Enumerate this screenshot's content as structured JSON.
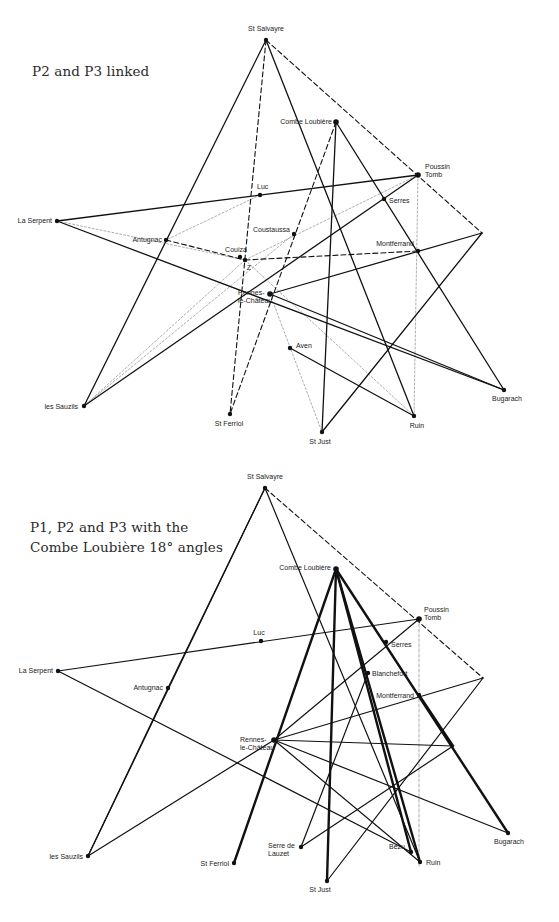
{
  "panels": [
    {
      "title": "P2 and P3 linked",
      "points": [
        {
          "id": "st-salvayre",
          "label": "St Salvayre",
          "x": 266,
          "y": 40,
          "lx": 266,
          "ly": 31,
          "anchor": "middle"
        },
        {
          "id": "combe-loubiere",
          "label": "Combe Loubière",
          "x": 336,
          "y": 122,
          "lx": 332,
          "ly": 124,
          "anchor": "end"
        },
        {
          "id": "poussin-tomb",
          "label": "Poussin",
          "label2": "Tomb",
          "x": 418,
          "y": 175,
          "lx": 425,
          "ly": 169,
          "anchor": "start"
        },
        {
          "id": "luc",
          "label": "Luc",
          "x": 260,
          "y": 195,
          "lx": 257,
          "ly": 189,
          "anchor": "start"
        },
        {
          "id": "la-serpent",
          "label": "La Serpent",
          "x": 57,
          "y": 221,
          "lx": 52,
          "ly": 223,
          "anchor": "end"
        },
        {
          "id": "serres",
          "label": "Serres",
          "x": 384,
          "y": 199,
          "lx": 389,
          "ly": 203,
          "anchor": "start"
        },
        {
          "id": "antugnac",
          "label": "Antugnac",
          "x": 166,
          "y": 240,
          "lx": 162,
          "ly": 242,
          "anchor": "end"
        },
        {
          "id": "coustaussa",
          "label": "Coustaussa",
          "x": 294,
          "y": 234,
          "lx": 290,
          "ly": 232,
          "anchor": "end"
        },
        {
          "id": "couiza",
          "label": "Couiza",
          "x": 240,
          "y": 257,
          "lx": 236,
          "ly": 252,
          "anchor": "middle"
        },
        {
          "id": "z",
          "label": "Z",
          "x": 245,
          "y": 260,
          "lx": 249,
          "ly": 270,
          "anchor": "middle"
        },
        {
          "id": "montferrand",
          "label": "Montferrand",
          "x": 418,
          "y": 251,
          "lx": 414,
          "ly": 246,
          "anchor": "end"
        },
        {
          "id": "rennes-le-chateau",
          "label": "Rennes-",
          "label2": "le-Château",
          "x": 270,
          "y": 294,
          "lx": 238,
          "ly": 295,
          "anchor": "start"
        },
        {
          "id": "aven",
          "label": "Aven",
          "x": 290,
          "y": 348,
          "lx": 296,
          "ly": 348,
          "anchor": "start"
        },
        {
          "id": "bugarach",
          "label": "Bugarach",
          "x": 504,
          "y": 390,
          "lx": 507,
          "ly": 401,
          "anchor": "middle"
        },
        {
          "id": "les-sauzils",
          "label": "les Sauzils",
          "x": 84,
          "y": 406,
          "lx": 78,
          "ly": 409,
          "anchor": "end"
        },
        {
          "id": "st-ferriol",
          "label": "St Ferriol",
          "x": 230,
          "y": 414,
          "lx": 229,
          "ly": 426,
          "anchor": "middle"
        },
        {
          "id": "ruin",
          "label": "Ruin",
          "x": 414,
          "y": 416,
          "lx": 417,
          "ly": 428,
          "anchor": "middle"
        },
        {
          "id": "st-just",
          "label": "St Just",
          "x": 322,
          "y": 432,
          "lx": 320,
          "ly": 444,
          "anchor": "middle"
        },
        {
          "id": "right-vertex",
          "label": "",
          "x": 482,
          "y": 233
        }
      ]
    },
    {
      "title_line1": "P1, P2 and P3 with the",
      "title_line2": "Combe Loubière 18° angles",
      "points": [
        {
          "id": "st-salvayre",
          "label": "St Salvayre",
          "x": 265,
          "y": 488,
          "lx": 265,
          "ly": 479,
          "anchor": "middle"
        },
        {
          "id": "combe-loubiere",
          "label": "Combe Loubière",
          "x": 336,
          "y": 569,
          "lx": 331,
          "ly": 570,
          "anchor": "end"
        },
        {
          "id": "poussin-tomb",
          "label": "Poussin",
          "label2": "Tomb",
          "x": 419,
          "y": 619,
          "lx": 424,
          "ly": 612,
          "anchor": "start"
        },
        {
          "id": "luc",
          "label": "Luc",
          "x": 261,
          "y": 641,
          "lx": 259,
          "ly": 635,
          "anchor": "middle"
        },
        {
          "id": "la-serpent",
          "label": "La Serpent",
          "x": 58,
          "y": 671,
          "lx": 53,
          "ly": 673,
          "anchor": "end"
        },
        {
          "id": "serres",
          "label": "Serres",
          "x": 386,
          "y": 642,
          "lx": 391,
          "ly": 647,
          "anchor": "start"
        },
        {
          "id": "blanchefort",
          "label": "Blanchefort",
          "x": 368,
          "y": 673,
          "lx": 372,
          "ly": 676,
          "anchor": "start"
        },
        {
          "id": "antugnac",
          "label": "Antugnac",
          "x": 168,
          "y": 688,
          "lx": 163,
          "ly": 690,
          "anchor": "end"
        },
        {
          "id": "montferrand",
          "label": "Montferrand",
          "x": 419,
          "y": 695,
          "lx": 414,
          "ly": 698,
          "anchor": "end"
        },
        {
          "id": "rennes-le-chateau",
          "label": "Rennes-",
          "label2": "le-Château",
          "x": 274,
          "y": 740,
          "lx": 240,
          "ly": 742,
          "anchor": "start"
        },
        {
          "id": "bugarach",
          "label": "Bugarach",
          "x": 508,
          "y": 833,
          "lx": 509,
          "ly": 844,
          "anchor": "middle"
        },
        {
          "id": "les-sauzils",
          "label": "les Sauzils",
          "x": 88,
          "y": 856,
          "lx": 83,
          "ly": 859,
          "anchor": "end"
        },
        {
          "id": "serre-de-lauzet",
          "label": "Serre de",
          "label2": "Lauzet",
          "x": 301,
          "y": 847,
          "lx": 268,
          "ly": 848,
          "anchor": "start"
        },
        {
          "id": "bezu",
          "label": "Bezu",
          "x": 411,
          "y": 852,
          "lx": 405,
          "ly": 849,
          "anchor": "end"
        },
        {
          "id": "st-ferriol",
          "label": "St Ferriol",
          "x": 234,
          "y": 863,
          "lx": 229,
          "ly": 866,
          "anchor": "end"
        },
        {
          "id": "ruin",
          "label": "Ruin",
          "x": 420,
          "y": 862,
          "lx": 426,
          "ly": 865,
          "anchor": "start"
        },
        {
          "id": "st-just",
          "label": "St Just",
          "x": 327,
          "y": 881,
          "lx": 320,
          "ly": 892,
          "anchor": "middle"
        },
        {
          "id": "right-vertex",
          "label": "",
          "x": 483,
          "y": 678
        },
        {
          "id": "mid-right",
          "label": "",
          "x": 453,
          "y": 746
        }
      ]
    }
  ],
  "edges_top": {
    "solid": [
      [
        "st-salvayre",
        "les-sauzils"
      ],
      [
        "st-salvayre",
        "ruin"
      ],
      [
        "la-serpent",
        "poussin-tomb"
      ],
      [
        "la-serpent",
        "bugarach"
      ],
      [
        "combe-loubiere",
        "st-just"
      ],
      [
        "combe-loubiere",
        "bugarach"
      ],
      [
        "poussin-tomb",
        "les-sauzils"
      ],
      [
        "right-vertex",
        "rennes-le-chateau"
      ],
      [
        "right-vertex",
        "st-just"
      ],
      [
        "rennes-le-chateau",
        "bugarach"
      ],
      [
        "aven",
        "ruin"
      ]
    ],
    "dashed": [
      [
        "st-salvayre",
        "st-ferriol"
      ],
      [
        "st-salvayre",
        "right-vertex"
      ],
      [
        "combe-loubiere",
        "st-ferriol"
      ],
      [
        "antugnac",
        "z"
      ],
      [
        "z",
        "montferrand"
      ]
    ],
    "dotted": [
      [
        "z",
        "les-sauzils"
      ],
      [
        "z",
        "poussin-tomb"
      ],
      [
        "z",
        "ruin"
      ],
      [
        "la-serpent",
        "z"
      ],
      [
        "coustaussa",
        "les-sauzils"
      ],
      [
        "rennes-le-chateau",
        "st-just"
      ],
      [
        "poussin-tomb",
        "ruin"
      ],
      [
        "luc",
        "antugnac"
      ]
    ]
  }
}
